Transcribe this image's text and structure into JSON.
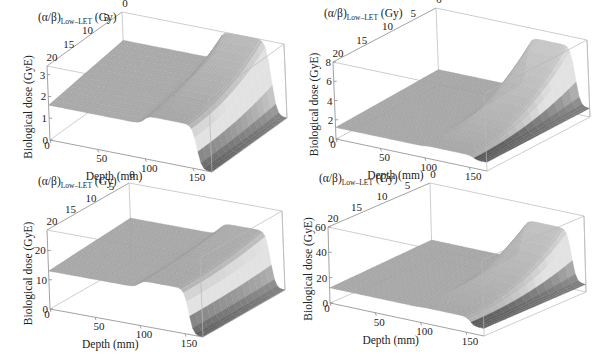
{
  "figure": {
    "panel_count": 4,
    "colors": {
      "box_line": "#b8b8b8",
      "axis_line": "#8a8a8a",
      "text": "#222222",
      "surface_light": "#e8e8e8",
      "surface_dark": "#3a3a3a"
    }
  },
  "chart_data": [
    {
      "id": "top-left",
      "type": "surface3d",
      "title": "",
      "xlabel": "Depth (mm)",
      "ylabel_main": "(α/β)",
      "ylabel_sub": "Low–LET",
      "ylabel_unit": " (Gy)",
      "zlabel": "Biological dose (GyE)",
      "x_ticks": [
        "0",
        "50",
        "100",
        "150"
      ],
      "x_tick_values": [
        0,
        50,
        100,
        150
      ],
      "y_ticks": [
        "20",
        "15",
        "10",
        "5",
        "0"
      ],
      "y_tick_values": [
        20,
        15,
        10,
        5,
        0
      ],
      "z_ticks": [
        "0",
        "1",
        "2",
        "3"
      ],
      "z_tick_values": [
        0,
        1,
        2,
        3
      ],
      "xlim": [
        0,
        170
      ],
      "ylim": [
        0,
        20
      ],
      "zlim": [
        0,
        3.4
      ],
      "surface": {
        "entrance_dose_at_ab20": 1.6,
        "entrance_dose_at_ab0": 2.1,
        "sobp_start_mm": 100,
        "sobp_end_mm": 155,
        "sobp_dose_at_ab20": 2.0,
        "sobp_dose_at_ab0": 3.4,
        "distal_dose": 0.0
      },
      "geometry": {
        "A": [
          47,
          66
        ],
        "B": [
          50,
          140
        ],
        "C": [
          146,
          42
        ],
        "E": [
          212,
          172
        ],
        "G": [
          290,
          57
        ],
        "H": [
          287,
          118
        ]
      }
    },
    {
      "id": "top-right",
      "type": "surface3d",
      "title": "",
      "xlabel": "Depth (mm)",
      "ylabel_main": "(α/β)",
      "ylabel_sub": "Low–LET",
      "ylabel_unit": " (Gy)",
      "zlabel": "Biological dose (GyE)",
      "x_ticks": [
        "0",
        "50",
        "100",
        "150"
      ],
      "x_tick_values": [
        0,
        50,
        100,
        150
      ],
      "y_ticks": [
        "20",
        "15",
        "10",
        "5",
        "0"
      ],
      "y_tick_values": [
        20,
        15,
        10,
        5,
        0
      ],
      "z_ticks": [
        "0",
        "2",
        "4",
        "6",
        "8"
      ],
      "z_tick_values": [
        0,
        2,
        4,
        6,
        8
      ],
      "xlim": [
        0,
        170
      ],
      "ylim": [
        0,
        20
      ],
      "zlim": [
        0,
        8
      ],
      "surface": {
        "entrance_dose_at_ab20": 1.2,
        "entrance_dose_at_ab0": 1.6,
        "sobp_start_mm": 100,
        "sobp_end_mm": 155,
        "sobp_dose_at_ab20": 1.3,
        "sobp_dose_at_ab0": 7.0,
        "distal_dose": 0.9
      },
      "geometry": {
        "A": [
          333,
          62
        ],
        "B": [
          336,
          139
        ],
        "C": [
          446,
          40
        ],
        "E": [
          487,
          171
        ],
        "G": [
          593,
          55
        ],
        "H": [
          590,
          117
        ]
      }
    },
    {
      "id": "bottom-left",
      "type": "surface3d",
      "title": "",
      "xlabel": "Depth (mm)",
      "ylabel_main": "(α/β)",
      "ylabel_sub": "Low–LET",
      "ylabel_unit": " (Gy)",
      "zlabel": "Biological dose (GyE)",
      "x_ticks": [
        "0",
        "50",
        "100",
        "150"
      ],
      "x_tick_values": [
        0,
        50,
        100,
        150
      ],
      "y_ticks": [
        "20",
        "15",
        "10",
        "5",
        "0"
      ],
      "y_tick_values": [
        20,
        15,
        10,
        5,
        0
      ],
      "z_ticks": [
        "0",
        "10",
        "20"
      ],
      "z_tick_values": [
        0,
        10,
        20
      ],
      "xlim": [
        0,
        170
      ],
      "ylim": [
        0,
        20
      ],
      "zlim": [
        0,
        27
      ],
      "surface": {
        "entrance_dose_at_ab20": 13.0,
        "entrance_dose_at_ab0": 15.0,
        "sobp_start_mm": 100,
        "sobp_end_mm": 155,
        "sobp_dose_at_ab20": 15.5,
        "sobp_dose_at_ab0": 19.0,
        "distal_dose": 0.0
      },
      "geometry": {
        "A": [
          47,
          230
        ],
        "B": [
          50,
          309
        ],
        "C": [
          150,
          212
        ],
        "E": [
          203,
          337
        ],
        "G": [
          288,
          222
        ],
        "H": [
          285,
          290
        ]
      }
    },
    {
      "id": "bottom-right",
      "type": "surface3d",
      "title": "",
      "xlabel": "Depth (mm)",
      "ylabel_main": "(α/β)",
      "ylabel_sub": "Low–LET",
      "ylabel_unit": " (Gy)",
      "zlabel": "Biological dose (GyE)",
      "x_ticks": [
        "0",
        "50",
        "100",
        "150"
      ],
      "x_tick_values": [
        0,
        50,
        100,
        150
      ],
      "y_ticks": [
        "20",
        "15",
        "10",
        "5",
        "0"
      ],
      "y_tick_values": [
        20,
        15,
        10,
        5,
        0
      ],
      "z_ticks": [
        "0",
        "20",
        "40",
        "60"
      ],
      "z_tick_values": [
        0,
        20,
        40,
        60
      ],
      "xlim": [
        0,
        170
      ],
      "ylim": [
        0,
        20
      ],
      "zlim": [
        0,
        60
      ],
      "surface": {
        "entrance_dose_at_ab20": 12.0,
        "entrance_dose_at_ab0": 15.0,
        "sobp_start_mm": 100,
        "sobp_end_mm": 155,
        "sobp_dose_at_ab20": 12.5,
        "sobp_dose_at_ab0": 47.0,
        "distal_dose": 6.0
      },
      "geometry": {
        "A": [
          328,
          227
        ],
        "B": [
          330,
          303
        ],
        "C": [
          446,
          213
        ],
        "E": [
          484,
          336
        ],
        "G": [
          588,
          222
        ],
        "H": [
          586,
          292
        ]
      }
    }
  ]
}
